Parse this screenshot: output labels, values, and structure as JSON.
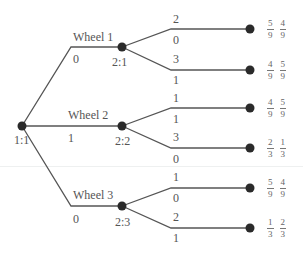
{
  "root": {
    "label": "1:1"
  },
  "wheels": [
    {
      "name": "Wheel 1",
      "edge_value": "0",
      "node_label": "2:1",
      "branches": [
        {
          "top": "2",
          "bottom": "0",
          "payoff": [
            [
              "5",
              "9"
            ],
            [
              "4",
              "9"
            ]
          ]
        },
        {
          "top": "3",
          "bottom": "1",
          "payoff": [
            [
              "4",
              "9"
            ],
            [
              "5",
              "9"
            ]
          ]
        }
      ]
    },
    {
      "name": "Wheel 2",
      "edge_value": "1",
      "node_label": "2:2",
      "branches": [
        {
          "top": "1",
          "bottom": "1",
          "payoff": [
            [
              "4",
              "9"
            ],
            [
              "5",
              "9"
            ]
          ]
        },
        {
          "top": "3",
          "bottom": "0",
          "payoff": [
            [
              "2",
              "3"
            ],
            [
              "1",
              "3"
            ]
          ]
        }
      ]
    },
    {
      "name": "Wheel 3",
      "edge_value": "0",
      "node_label": "2:3",
      "branches": [
        {
          "top": "1",
          "bottom": "0",
          "payoff": [
            [
              "5",
              "9"
            ],
            [
              "4",
              "9"
            ]
          ]
        },
        {
          "top": "2",
          "bottom": "1",
          "payoff": [
            [
              "1",
              "3"
            ],
            [
              "2",
              "3"
            ]
          ]
        }
      ]
    }
  ],
  "colors": {
    "line": "#555555",
    "node": "#2a2a2a"
  }
}
